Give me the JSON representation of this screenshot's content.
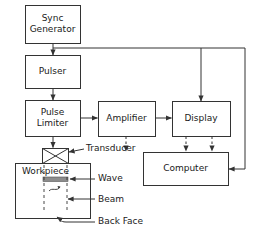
{
  "diagram": {
    "line_color": "#333333",
    "fill_color": "#ffffff",
    "wave_color": "#8c8c8c",
    "text_color": "#1a1a1a",
    "blocks": [
      {
        "id": "sync_generator",
        "label": "Sync\nGenerator",
        "x": 25,
        "y": 5,
        "w": 55,
        "h": 38
      },
      {
        "id": "pulser",
        "label": "Pulser",
        "x": 25,
        "y": 55,
        "w": 55,
        "h": 33
      },
      {
        "id": "pulse_limiter",
        "label": "Pulse\nLimiter",
        "x": 25,
        "y": 100,
        "w": 55,
        "h": 36
      },
      {
        "id": "amplifier",
        "label": "Amplifier",
        "x": 98,
        "y": 101,
        "w": 57,
        "h": 35
      },
      {
        "id": "display",
        "label": "Display",
        "x": 172,
        "y": 101,
        "w": 58,
        "h": 35
      },
      {
        "id": "computer",
        "label": "Computer",
        "x": 143,
        "y": 152,
        "w": 85,
        "h": 33
      }
    ],
    "workpiece": {
      "label": "Workpiece",
      "x": 15,
      "y": 163,
      "w": 75,
      "h": 55,
      "label_x": 22,
      "label_y": 168
    },
    "transducer": {
      "label": "Transducer",
      "x": 42,
      "y": 148,
      "w": 26,
      "h": 15,
      "label_x": 86,
      "label_y": 145
    },
    "callouts": [
      {
        "id": "wave",
        "label": "Wave",
        "x": 98,
        "y": 173
      },
      {
        "id": "beam",
        "label": "Beam",
        "x": 98,
        "y": 194
      },
      {
        "id": "back_face",
        "label": "Back Face",
        "x": 98,
        "y": 217
      }
    ]
  }
}
